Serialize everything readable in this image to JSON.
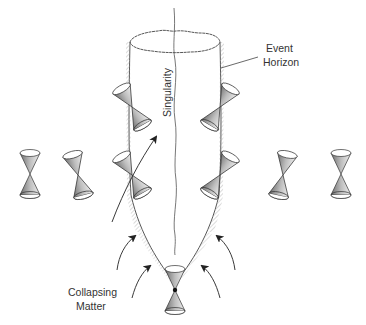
{
  "diagram": {
    "labels": {
      "event_horizon_line1": "Event",
      "event_horizon_line2": "Horizon",
      "singularity": "Singularity",
      "collapsing_matter_line1": "Collapsing",
      "collapsing_matter_line2": "Matter"
    },
    "elements": {
      "event_horizon": "tapered cylinder (spacetime tube) with hatched surface",
      "singularity": "wavy vertical line through center",
      "light_cones": {
        "far_left_count": 2,
        "on_horizon_left_count": 2,
        "on_horizon_right_count": 2,
        "far_right_count": 2,
        "at_apex_count": 1
      },
      "collapsing_matter_arrows": 6,
      "worldline_arrow": 1
    },
    "colors": {
      "line": "#333333",
      "cone_fill_dark": "#8a8a8a",
      "cone_fill_light": "#e6e6e6",
      "background": "#ffffff"
    }
  }
}
